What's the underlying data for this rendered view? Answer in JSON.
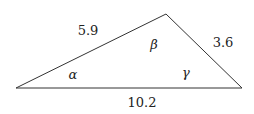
{
  "diagram": {
    "type": "triangle",
    "vertices": {
      "left": [
        16,
        88
      ],
      "top": [
        166,
        14
      ],
      "right": [
        242,
        88
      ]
    },
    "stroke_color": "#333333",
    "sides": {
      "left_top": "5.9",
      "top_right": "3.6",
      "base": "10.2"
    },
    "angles": {
      "alpha": "α",
      "beta": "β",
      "gamma": "γ"
    }
  }
}
